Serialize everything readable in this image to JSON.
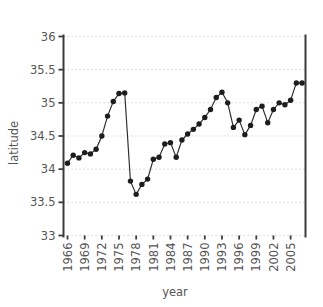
{
  "chart_data": {
    "type": "line",
    "title": "",
    "xlabel": "year",
    "ylabel": "latitude",
    "xlim": [
      1965.3,
      2007.6
    ],
    "ylim": [
      33,
      36
    ],
    "grid": true,
    "legend": "none",
    "marker": "filled-circle",
    "xticks": [
      1966,
      1969,
      1972,
      1975,
      1978,
      1981,
      1984,
      1987,
      1990,
      1993,
      1996,
      1999,
      2002,
      2005
    ],
    "xtick_labels": [
      "1966",
      "1969",
      "1972",
      "1975",
      "1978",
      "1981",
      "1984",
      "1987",
      "1990",
      "1993",
      "1996",
      "1999",
      "2002",
      "2005"
    ],
    "yticks": [
      33,
      33.5,
      34,
      34.5,
      35,
      35.5,
      36
    ],
    "ytick_labels": [
      "33",
      "33.5",
      "34",
      "34.5",
      "35",
      "35.5",
      "36"
    ],
    "x": [
      1966,
      1967,
      1968,
      1969,
      1970,
      1971,
      1972,
      1973,
      1974,
      1975,
      1976,
      1977,
      1978,
      1979,
      1980,
      1981,
      1982,
      1983,
      1984,
      1985,
      1986,
      1987,
      1988,
      1989,
      1990,
      1991,
      1992,
      1993,
      1994,
      1995,
      1996,
      1997,
      1998,
      1999,
      2000,
      2001,
      2002,
      2003,
      2004,
      2005,
      2006,
      2007
    ],
    "y": [
      34.09,
      34.21,
      34.17,
      34.25,
      34.23,
      34.3,
      34.5,
      34.8,
      35.02,
      35.14,
      35.15,
      33.82,
      33.62,
      33.77,
      33.85,
      34.15,
      34.18,
      34.38,
      34.4,
      34.18,
      34.44,
      34.53,
      34.6,
      34.68,
      34.78,
      34.9,
      35.08,
      35.16,
      35.0,
      34.63,
      34.74,
      34.52,
      34.66,
      34.9,
      34.95,
      34.7,
      34.9,
      35.0,
      34.97,
      35.04,
      35.3,
      35.3
    ],
    "series": [
      {
        "name": "latitude",
        "values": [
          34.09,
          34.21,
          34.17,
          34.25,
          34.23,
          34.3,
          34.5,
          34.8,
          35.02,
          35.14,
          35.15,
          33.82,
          33.62,
          33.77,
          33.85,
          34.15,
          34.18,
          34.38,
          34.4,
          34.18,
          34.44,
          34.53,
          34.6,
          34.68,
          34.78,
          34.9,
          35.08,
          35.16,
          35.0,
          34.63,
          34.74,
          34.52,
          34.66,
          34.9,
          34.95,
          34.7,
          34.9,
          35.0,
          34.97,
          35.04,
          35.3,
          35.3
        ]
      }
    ],
    "colors": {
      "line": "#2b2b2b",
      "marker": "#1d1d1d",
      "grid": "#cfcfcf",
      "axis": "#3a3a3a",
      "text": "#555555",
      "background": "#ffffff"
    }
  }
}
